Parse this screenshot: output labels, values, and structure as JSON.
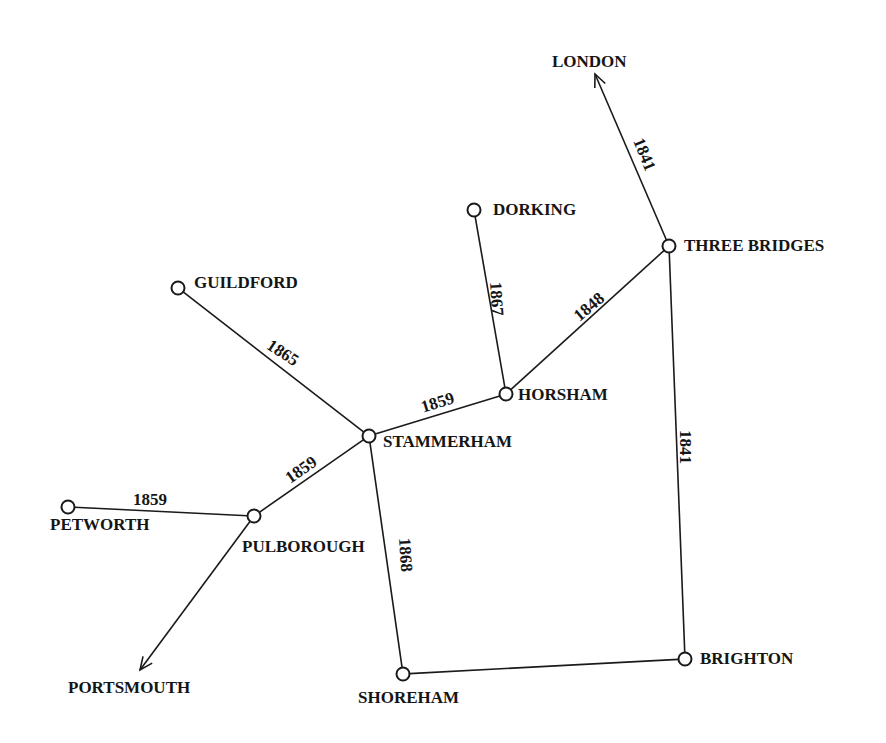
{
  "stations": [
    {
      "id": "london",
      "name": "LONDON",
      "x": 595,
      "y": 74,
      "type": "terminus-arrow",
      "label_x": 552,
      "label_y": 67
    },
    {
      "id": "three_bridges",
      "name": "THREE BRIDGES",
      "x": 669,
      "y": 246,
      "type": "node",
      "label_x": 684,
      "label_y": 251
    },
    {
      "id": "dorking",
      "name": "DORKING",
      "x": 474,
      "y": 210,
      "type": "node",
      "label_x": 493,
      "label_y": 215
    },
    {
      "id": "guildford",
      "name": "GUILDFORD",
      "x": 178,
      "y": 288,
      "type": "node",
      "label_x": 194,
      "label_y": 288
    },
    {
      "id": "horsham",
      "name": "HORSHAM",
      "x": 506,
      "y": 394,
      "type": "node",
      "label_x": 518,
      "label_y": 400
    },
    {
      "id": "stammerham",
      "name": "STAMMERHAM",
      "x": 369,
      "y": 436,
      "type": "node",
      "label_x": 383,
      "label_y": 447
    },
    {
      "id": "pulborough",
      "name": "PULBOROUGH",
      "x": 254,
      "y": 516,
      "type": "node",
      "label_x": 242,
      "label_y": 552
    },
    {
      "id": "petworth",
      "name": "PETWORTH",
      "x": 68,
      "y": 507,
      "type": "node",
      "label_x": 50,
      "label_y": 530
    },
    {
      "id": "portsmouth",
      "name": "PORTSMOUTH",
      "x": 140,
      "y": 670,
      "type": "terminus-arrow",
      "label_x": 68,
      "label_y": 693
    },
    {
      "id": "shoreham",
      "name": "SHOREHAM",
      "x": 403,
      "y": 674,
      "type": "node",
      "label_x": 358,
      "label_y": 703
    },
    {
      "id": "brighton",
      "name": "BRIGHTON",
      "x": 685,
      "y": 659,
      "type": "node",
      "label_x": 700,
      "label_y": 664
    }
  ],
  "lines": [
    {
      "from": "three_bridges",
      "to": "london",
      "year": "1841",
      "label_x": 643,
      "label_y": 155,
      "label_rotate": 68
    },
    {
      "from": "three_bridges",
      "to": "brighton",
      "year": "1841",
      "label_x": 684,
      "label_y": 447,
      "label_rotate": 90
    },
    {
      "from": "three_bridges",
      "to": "horsham",
      "year": "1848",
      "label_x": 590,
      "label_y": 308,
      "label_rotate": -40
    },
    {
      "from": "dorking",
      "to": "horsham",
      "year": "1867",
      "label_x": 495,
      "label_y": 299,
      "label_rotate": 86
    },
    {
      "from": "horsham",
      "to": "stammerham",
      "year": "1859",
      "label_x": 438,
      "label_y": 404,
      "label_rotate": -17
    },
    {
      "from": "guildford",
      "to": "stammerham",
      "year": "1865",
      "label_x": 282,
      "label_y": 354,
      "label_rotate": 33
    },
    {
      "from": "stammerham",
      "to": "pulborough",
      "year": "1859",
      "label_x": 302,
      "label_y": 471,
      "label_rotate": -35
    },
    {
      "from": "petworth",
      "to": "pulborough",
      "year": "1859",
      "label_x": 150,
      "label_y": 501,
      "label_rotate": 0
    },
    {
      "from": "pulborough",
      "to": "portsmouth",
      "year": "",
      "label_x": 0,
      "label_y": 0,
      "label_rotate": 0
    },
    {
      "from": "stammerham",
      "to": "shoreham",
      "year": "1868",
      "label_x": 404,
      "label_y": 555,
      "label_rotate": 86
    },
    {
      "from": "shoreham",
      "to": "brighton",
      "year": "",
      "label_x": 0,
      "label_y": 0,
      "label_rotate": 0
    }
  ],
  "colors": {
    "ink": "#1a1a1a",
    "background": "#ffffff"
  }
}
